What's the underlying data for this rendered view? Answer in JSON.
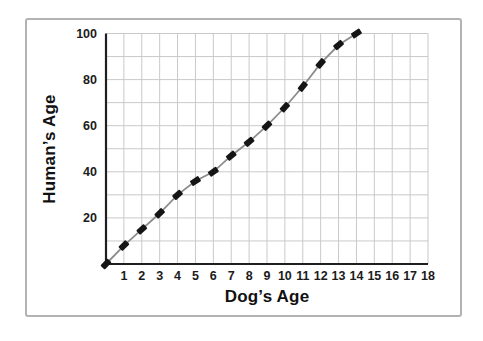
{
  "chart_data": {
    "type": "line",
    "title": "",
    "xlabel": "Dog’s Age",
    "ylabel": "Human’s Age",
    "x": [
      0,
      1,
      2,
      3,
      4,
      5,
      6,
      7,
      8,
      9,
      10,
      11,
      12,
      13,
      14
    ],
    "y": [
      0,
      8,
      15,
      22,
      30,
      36,
      40,
      47,
      53,
      60,
      68,
      77,
      87,
      95,
      100
    ],
    "xlim": [
      0,
      18
    ],
    "ylim": [
      0,
      100
    ],
    "x_ticks": [
      1,
      2,
      3,
      4,
      5,
      6,
      7,
      8,
      9,
      10,
      11,
      12,
      13,
      14,
      15,
      16,
      17,
      18
    ],
    "y_ticks": [
      20,
      40,
      60,
      80,
      100
    ],
    "grid": {
      "on": true,
      "x_step": 1,
      "y_step": 10
    },
    "legend": "none",
    "marker": "tilted-diamond-dash",
    "colors": {
      "background": "#ffffff",
      "frame_border": "#b2b2b2",
      "grid": "#c9c9c9",
      "axis": "#1f1f1f",
      "line": "#8c8c8c",
      "marker": "#151515",
      "text": "#1b1b1b"
    }
  }
}
